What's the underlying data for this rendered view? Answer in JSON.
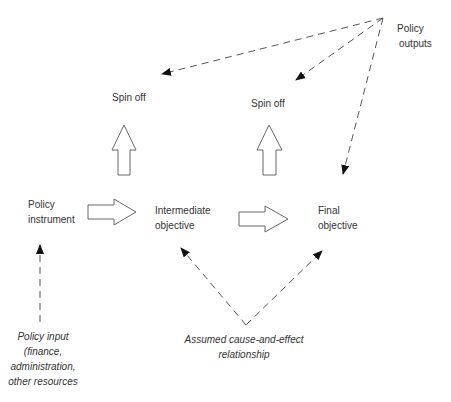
{
  "diagram": {
    "type": "policy-logic-flow",
    "nodes": {
      "policy_instrument": {
        "line1": "Policy",
        "line2": "instrument"
      },
      "intermediate_objective": {
        "line1": "Intermediate",
        "line2": "objective"
      },
      "final_objective": {
        "line1": "Final",
        "line2": "objective"
      },
      "spin_off_left": {
        "label": "Spin off"
      },
      "spin_off_right": {
        "label": "Spin off"
      },
      "policy_outputs": {
        "line1": "Policy",
        "line2": "outputs"
      },
      "policy_input": {
        "line1": "Policy input",
        "line2": "(finance,",
        "line3": "administration,",
        "line4": "other resources"
      },
      "assumed_relationship": {
        "line1": "Assumed cause-and-effect",
        "line2": "relationship"
      }
    },
    "edges": [
      {
        "from": "policy_instrument",
        "to": "intermediate_objective",
        "style": "hollow-block-arrow"
      },
      {
        "from": "intermediate_objective",
        "to": "final_objective",
        "style": "hollow-block-arrow"
      },
      {
        "from": "intermediate_objective",
        "to": "spin_off_left",
        "style": "hollow-block-arrow"
      },
      {
        "from": "final_objective",
        "to": "spin_off_right",
        "style": "hollow-block-arrow"
      },
      {
        "from": "policy_outputs",
        "to": "spin_off_left",
        "style": "dashed-arrow"
      },
      {
        "from": "policy_outputs",
        "to": "spin_off_right",
        "style": "dashed-arrow"
      },
      {
        "from": "policy_outputs",
        "to": "final_objective",
        "style": "dashed-arrow"
      },
      {
        "from": "policy_input",
        "to": "policy_instrument",
        "style": "dashed-arrow"
      },
      {
        "from": "assumed_relationship",
        "to": "intermediate_objective",
        "style": "dashed-arrow"
      },
      {
        "from": "assumed_relationship",
        "to": "final_objective",
        "style": "dashed-arrow"
      }
    ],
    "colors": {
      "background": "#ffffff",
      "text": "#333333",
      "stroke": "#555555",
      "arrowhead": "#111111"
    }
  }
}
